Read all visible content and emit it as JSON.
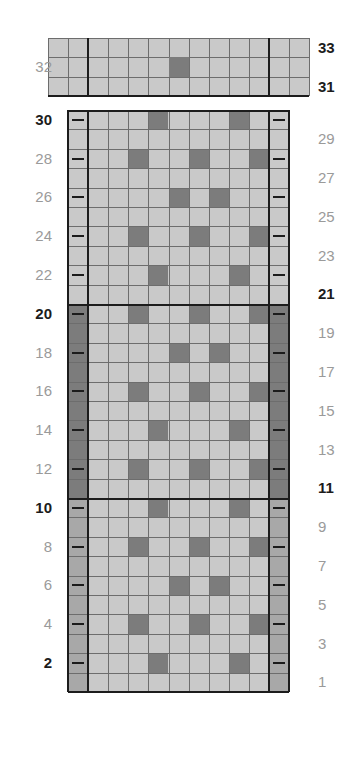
{
  "chart_data": {
    "type": "heatmap",
    "title": "",
    "xlabel": "",
    "ylabel": "",
    "columns": 11,
    "rows": 33,
    "legend": [],
    "colors": {
      "light": "#c9c9c9",
      "mid": "#a8a8a8",
      "dark": "#7c7c7c",
      "gridline": "#6d6d6d",
      "heavyline": "#1c1c1c",
      "label": "#9a9a9a",
      "label_bold": "#1c1c1c",
      "background": "#ffffff"
    },
    "sections": [
      {
        "name": "top-band",
        "row_start": 31,
        "row_end": 33,
        "edge_style": "light",
        "extended": true
      },
      {
        "name": "upper-block",
        "row_start": 21,
        "row_end": 30,
        "edge_style": "light",
        "extended": false
      },
      {
        "name": "middle-block",
        "row_start": 11,
        "row_end": 20,
        "edge_style": "dark",
        "extended": false
      },
      {
        "name": "lower-block",
        "row_start": 1,
        "row_end": 10,
        "edge_style": "mid",
        "extended": false
      }
    ],
    "dark_cells_by_row": {
      "32": [
        5
      ],
      "30": [
        2,
        6
      ],
      "28": [
        1,
        4,
        7
      ],
      "26": [
        3,
        5
      ],
      "24": [
        1,
        4,
        7
      ],
      "22": [
        2,
        6
      ],
      "20": [
        1,
        4,
        7
      ],
      "18": [
        3,
        5
      ],
      "16": [
        1,
        4,
        7
      ],
      "14": [
        2,
        6
      ],
      "12": [
        1,
        4,
        7
      ],
      "10": [
        2,
        6
      ],
      "8": [
        1,
        4,
        7
      ],
      "6": [
        3,
        5
      ],
      "4": [
        1,
        4,
        7
      ],
      "2": [
        2,
        6
      ]
    },
    "left_labels": [
      {
        "row": 32,
        "text": "32",
        "bold": false
      },
      {
        "row": 30,
        "text": "30",
        "bold": true
      },
      {
        "row": 28,
        "text": "28",
        "bold": false
      },
      {
        "row": 26,
        "text": "26",
        "bold": false
      },
      {
        "row": 24,
        "text": "24",
        "bold": false
      },
      {
        "row": 22,
        "text": "22",
        "bold": false
      },
      {
        "row": 20,
        "text": "20",
        "bold": true
      },
      {
        "row": 18,
        "text": "18",
        "bold": false
      },
      {
        "row": 16,
        "text": "16",
        "bold": false
      },
      {
        "row": 14,
        "text": "14",
        "bold": false
      },
      {
        "row": 12,
        "text": "12",
        "bold": false
      },
      {
        "row": 10,
        "text": "10",
        "bold": true
      },
      {
        "row": 8,
        "text": "8",
        "bold": false
      },
      {
        "row": 6,
        "text": "6",
        "bold": false
      },
      {
        "row": 4,
        "text": "4",
        "bold": false
      },
      {
        "row": 2,
        "text": "2",
        "bold": true
      }
    ],
    "right_labels": [
      {
        "row": 33,
        "text": "33",
        "bold": true
      },
      {
        "row": 31,
        "text": "31",
        "bold": true
      },
      {
        "row": 29,
        "text": "29",
        "bold": false
      },
      {
        "row": 27,
        "text": "27",
        "bold": false
      },
      {
        "row": 25,
        "text": "25",
        "bold": false
      },
      {
        "row": 23,
        "text": "23",
        "bold": false
      },
      {
        "row": 21,
        "text": "21",
        "bold": true
      },
      {
        "row": 19,
        "text": "19",
        "bold": false
      },
      {
        "row": 17,
        "text": "17",
        "bold": false
      },
      {
        "row": 15,
        "text": "15",
        "bold": false
      },
      {
        "row": 13,
        "text": "13",
        "bold": false
      },
      {
        "row": 11,
        "text": "11",
        "bold": true
      },
      {
        "row": 9,
        "text": "9",
        "bold": false
      },
      {
        "row": 7,
        "text": "7",
        "bold": false
      },
      {
        "row": 5,
        "text": "5",
        "bold": false
      },
      {
        "row": 3,
        "text": "3",
        "bold": false
      },
      {
        "row": 1,
        "text": "1",
        "bold": false
      }
    ],
    "tick_rows_left": [
      30,
      28,
      26,
      24,
      22,
      20,
      18,
      16,
      14,
      12,
      10,
      8,
      6,
      4,
      2
    ],
    "tick_rows_right": [
      30,
      28,
      26,
      24,
      22,
      20,
      18,
      16,
      14,
      12,
      10,
      8,
      6,
      4,
      2
    ],
    "heavy_row_separators": [
      30,
      20,
      10
    ],
    "heavy_column_separators": [
      1,
      10
    ]
  }
}
